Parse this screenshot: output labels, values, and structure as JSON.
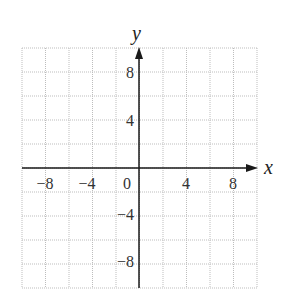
{
  "chart_data": {
    "type": "scatter",
    "title": "",
    "xlabel": "x",
    "ylabel": "y",
    "xlim": [
      -10,
      10
    ],
    "ylim": [
      -10,
      10
    ],
    "grid": true,
    "grid_step": 2,
    "x_ticks": [
      -8,
      -4,
      0,
      4,
      8
    ],
    "y_ticks": [
      -8,
      -4,
      4,
      8
    ],
    "x_tick_labels": [
      "−8",
      "−4",
      "0",
      "4",
      "8"
    ],
    "y_tick_labels": [
      "−8",
      "−4",
      "4",
      "8"
    ],
    "series": []
  },
  "labels": {
    "x_axis": "x",
    "y_axis": "y",
    "x_ticks": [
      "−8",
      "−4",
      "0",
      "4",
      "8"
    ],
    "y_ticks": [
      "8",
      "4",
      "−4",
      "−8"
    ]
  },
  "colors": {
    "grid": "#bdbdbd",
    "axis": "#1a1a1a"
  }
}
